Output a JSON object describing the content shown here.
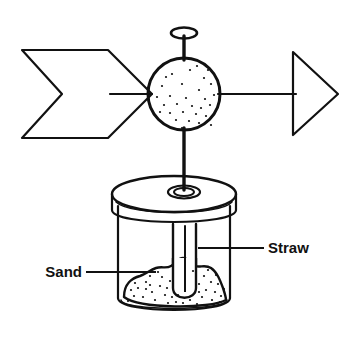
{
  "figure": {
    "background_color": "#ffffff",
    "ink_color": "#111111",
    "line_width": 2.2
  },
  "labels": [
    {
      "id": "straw",
      "text": "Straw",
      "text_x": 268,
      "text_y": 253,
      "anchor": "start",
      "leader": {
        "x1": 198,
        "y1": 248,
        "x2": 264,
        "y2": 248
      }
    },
    {
      "id": "sand",
      "text": "Sand",
      "text_x": 82,
      "text_y": 277,
      "anchor": "end",
      "leader": {
        "x1": 86,
        "y1": 272,
        "x2": 156,
        "y2": 272
      }
    }
  ],
  "parts": {
    "ball": {
      "name": "stippled-ball",
      "cx": 184,
      "cy": 94,
      "r": 36,
      "stipple_count": 30
    },
    "fletching": {
      "name": "chevron-tail",
      "description": "open chevron / arrow fletching on the left side"
    },
    "arrowhead": {
      "name": "triangle-head",
      "description": "open triangle pointing right"
    },
    "axle": {
      "name": "horizontal-axle",
      "y": 94,
      "x1": 110,
      "x2": 296
    },
    "rod": {
      "name": "vertical-straw-rod",
      "x": 184,
      "y_top": 34,
      "y_bottom": 192
    },
    "ring_top": {
      "name": "straw-top-ring",
      "cx": 184,
      "cy": 34,
      "rx": 13,
      "ry": 5
    },
    "grommet": {
      "name": "lid-grommet-ring",
      "cx": 184,
      "cy": 192,
      "rx": 15,
      "ry": 6
    },
    "lid": {
      "name": "jar-lid-disc",
      "cx": 174,
      "cy": 194,
      "rx": 62,
      "ry": 18,
      "thickness": 28
    },
    "jar": {
      "name": "glass-jar",
      "top_y": 222,
      "bottom_y": 312,
      "left_x": 118,
      "right_x": 230
    },
    "straw_tube": {
      "name": "straw-inside-jar",
      "x_left": 173,
      "x_right": 196,
      "y_top": 222,
      "y_bottom": 300
    },
    "sand": {
      "name": "sand-mound",
      "description": "irregular lumpy mound of stippled sand in the jar bottom",
      "stipple_count": 44
    }
  }
}
